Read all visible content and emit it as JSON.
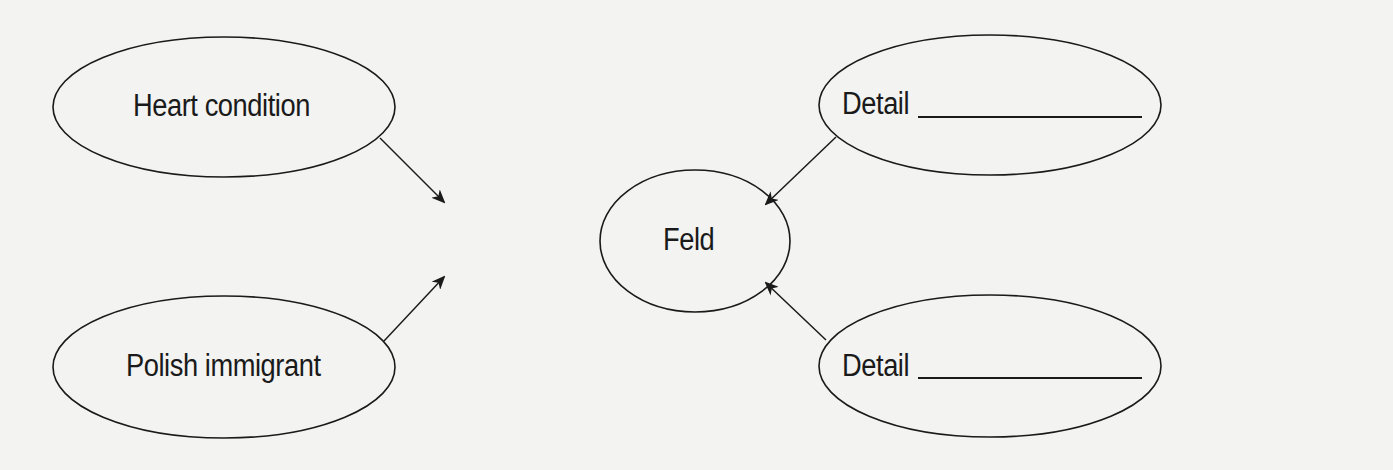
{
  "diagram": {
    "type": "concept-web",
    "colors": {
      "background": "#f3f3f1",
      "stroke": "#1a1a1a",
      "text": "#1a1a1a"
    },
    "center": {
      "label": "Feld"
    },
    "nodes": [
      {
        "id": "top-left",
        "label": "Heart condition",
        "blank": false
      },
      {
        "id": "bottom-left",
        "label": "Polish immigrant",
        "blank": false
      },
      {
        "id": "top-right",
        "label": "Detail",
        "blank": true
      },
      {
        "id": "bottom-right",
        "label": "Detail",
        "blank": true
      }
    ],
    "edges": [
      {
        "from": "top-left",
        "to": "center"
      },
      {
        "from": "bottom-left",
        "to": "center"
      },
      {
        "from": "top-right",
        "to": "center"
      },
      {
        "from": "bottom-right",
        "to": "center"
      }
    ]
  }
}
